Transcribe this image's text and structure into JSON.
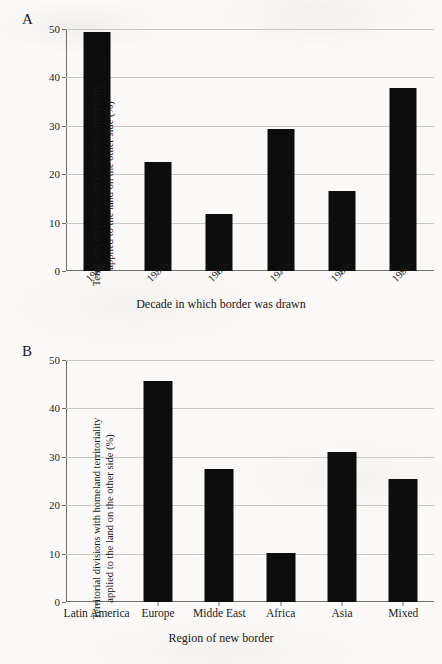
{
  "figure": {
    "panels": [
      {
        "letter": "A",
        "ylabel_line1": "Territorial divisions with homeland territoriality",
        "ylabel_line2": "applied to the land on the other side (%)",
        "xlabel": "Decade in which border was drawn"
      },
      {
        "letter": "B",
        "ylabel_line1": "Territorial divisions with homeland territoriality",
        "ylabel_line2": "applied to the land on the other side (%)",
        "xlabel": "Region of new border"
      }
    ]
  },
  "chart_data": [
    {
      "type": "bar",
      "title": "A",
      "categories": [
        "1940s",
        "1950s",
        "1960s",
        "1970s",
        "1980s",
        "1990s"
      ],
      "values": [
        49.3,
        22.6,
        11.8,
        29.3,
        16.5,
        37.8
      ],
      "xlabel": "Decade in which border was drawn",
      "ylabel": "Territorial divisions with homeland territoriality applied to the land on the other side (%)",
      "ylim": [
        0,
        50
      ],
      "yticks": [
        0,
        10,
        20,
        30,
        40,
        50
      ],
      "ytick_labels": [
        "0",
        "10",
        "20",
        "30",
        "40",
        "50"
      ],
      "grid": true,
      "legend": false,
      "bar_color": "#0d0d0d",
      "xtick_label_rotation": -45
    },
    {
      "type": "bar",
      "title": "B",
      "categories": [
        "Latin America",
        "Europe",
        "Midde East",
        "Africa",
        "Asia",
        "Mixed"
      ],
      "values": [
        0,
        45.7,
        27.5,
        10.1,
        31.0,
        25.5
      ],
      "xlabel": "Region of new border",
      "ylabel": "Territorial divisions with homeland territoriality applied to the land on the other side (%)",
      "ylim": [
        0,
        50
      ],
      "yticks": [
        0,
        10,
        20,
        30,
        40,
        50
      ],
      "ytick_labels": [
        "0",
        "10",
        "20",
        "30",
        "40",
        "50"
      ],
      "grid": true,
      "legend": false,
      "bar_color": "#0d0d0d",
      "xtick_label_rotation": 0
    }
  ]
}
